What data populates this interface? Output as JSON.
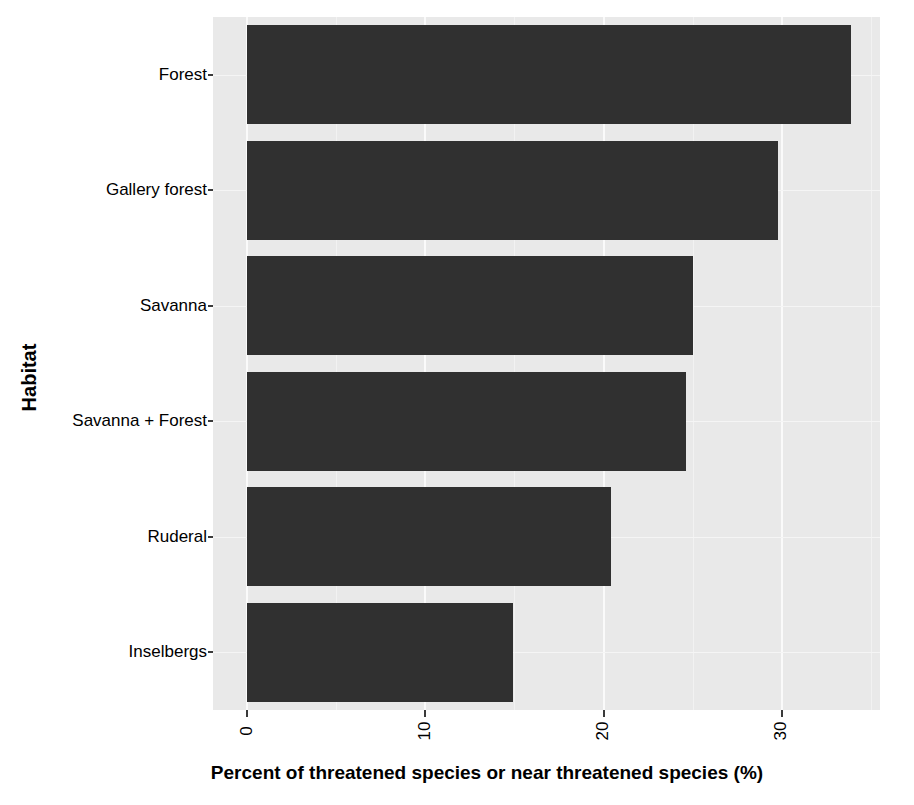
{
  "chart_data": {
    "type": "bar",
    "orientation": "horizontal",
    "title": "",
    "xlabel": "Percent of threatened species or near threatened species (%)",
    "ylabel": "Habitat",
    "categories": [
      "Forest",
      "Gallery forest",
      "Savanna",
      "Savanna + Forest",
      "Ruderal",
      "Inselbergs"
    ],
    "values": [
      33.9,
      29.8,
      25.0,
      24.6,
      20.4,
      14.9
    ],
    "xlim": [
      -1.9,
      35.5
    ],
    "ylim_categories": 6,
    "xticks": [
      0,
      10,
      20,
      30
    ],
    "xticklabels": [
      "0",
      "10",
      "20",
      "30"
    ],
    "xtick_rotation": 90,
    "minor_gridlines_x": [
      5,
      15,
      25,
      35
    ],
    "grid": true,
    "legend": false,
    "bar_color": "#303030",
    "panel_background": "#e9e9e9",
    "major_gridline_color": "#fafafa",
    "minor_gridline_color": "#f2f2f2",
    "figure_background": "#ffffff"
  },
  "axes": {
    "y": {
      "title": "Habitat",
      "ticks": [
        {
          "label": "Forest"
        },
        {
          "label": "Gallery forest"
        },
        {
          "label": "Savanna"
        },
        {
          "label": "Savanna + Forest"
        },
        {
          "label": "Ruderal"
        },
        {
          "label": "Inselbergs"
        }
      ]
    },
    "x": {
      "title": "Percent of threatened species or near threatened species (%)",
      "ticks": [
        {
          "label": "0",
          "value": 0
        },
        {
          "label": "10",
          "value": 10
        },
        {
          "label": "20",
          "value": 20
        },
        {
          "label": "30",
          "value": 30
        }
      ]
    }
  }
}
